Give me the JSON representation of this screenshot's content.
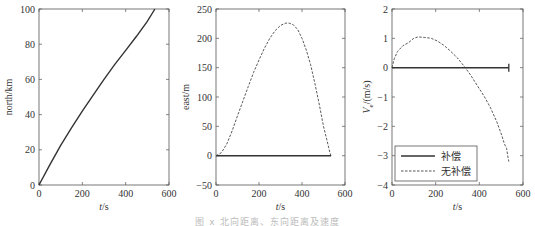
{
  "chart_data": [
    {
      "type": "line",
      "title": "",
      "xlabel": "t/s",
      "ylabel": "north/km",
      "xlim": [
        0,
        600
      ],
      "ylim": [
        0,
        100
      ],
      "xticks": [
        0,
        200,
        400,
        600
      ],
      "yticks": [
        0,
        20,
        40,
        60,
        80,
        100
      ],
      "grid": false,
      "series": [
        {
          "name": "north",
          "style": "solid",
          "x": [
            0,
            50,
            100,
            150,
            200,
            250,
            300,
            350,
            400,
            450,
            500,
            535
          ],
          "y": [
            0,
            11.5,
            22.5,
            32.5,
            42,
            51,
            60,
            68.5,
            76.5,
            84.5,
            93,
            100
          ]
        }
      ]
    },
    {
      "type": "line",
      "title": "",
      "xlabel": "t/s",
      "ylabel": "east/m",
      "xlim": [
        0,
        600
      ],
      "ylim": [
        -50,
        250
      ],
      "xticks": [
        0,
        200,
        400,
        600
      ],
      "yticks": [
        -50,
        0,
        50,
        100,
        150,
        200,
        250
      ],
      "grid": false,
      "series": [
        {
          "name": "补偿",
          "style": "solid",
          "x": [
            0,
            535
          ],
          "y": [
            0,
            0
          ]
        },
        {
          "name": "无补偿",
          "style": "dashed",
          "x": [
            0,
            25,
            50,
            75,
            100,
            125,
            150,
            175,
            200,
            225,
            250,
            275,
            300,
            325,
            340,
            360,
            380,
            400,
            420,
            440,
            460,
            480,
            500,
            515,
            530,
            535
          ],
          "y": [
            0,
            5,
            20,
            42,
            68,
            93,
            118,
            142,
            163,
            183,
            200,
            213,
            222,
            226,
            226,
            223,
            215,
            200,
            180,
            155,
            123,
            88,
            50,
            28,
            5,
            0
          ]
        }
      ]
    },
    {
      "type": "line",
      "title": "",
      "xlabel": "t/s",
      "ylabel": "V_e/(m/s)",
      "xlim": [
        0,
        600
      ],
      "ylim": [
        -4,
        2
      ],
      "xticks": [
        0,
        200,
        400,
        600
      ],
      "yticks": [
        -4,
        -3,
        -2,
        -1,
        0,
        1,
        2
      ],
      "grid": false,
      "legend": {
        "position": "lower left",
        "entries": [
          "补偿",
          "无补偿"
        ]
      },
      "series": [
        {
          "name": "补偿",
          "style": "solid",
          "x": [
            0,
            535
          ],
          "y": [
            0,
            0
          ]
        },
        {
          "name": "无补偿",
          "style": "dashed",
          "x": [
            0,
            10,
            25,
            50,
            75,
            100,
            120,
            150,
            180,
            210,
            240,
            270,
            300,
            330,
            360,
            390,
            420,
            450,
            480,
            500,
            515,
            525,
            530,
            535
          ],
          "y": [
            0,
            0.3,
            0.55,
            0.75,
            0.85,
            1.0,
            1.05,
            1.03,
            1.0,
            0.9,
            0.75,
            0.55,
            0.33,
            0.05,
            -0.25,
            -0.6,
            -0.95,
            -1.35,
            -1.85,
            -2.25,
            -2.6,
            -2.75,
            -3.0,
            -3.2
          ]
        }
      ]
    }
  ],
  "figure": {
    "xlabel_text": "t/s",
    "panels": [
      {
        "ylabel": "north/km"
      },
      {
        "ylabel": "east/m"
      },
      {
        "ylabel_main": "V",
        "ylabel_sub": "e",
        "ylabel_rest": "/(m/s)"
      }
    ],
    "legend": {
      "items": [
        {
          "label": "补偿",
          "style": "solid"
        },
        {
          "label": "无补偿",
          "style": "dashed"
        }
      ]
    },
    "caption": "图 x  北向距离、东向距离及速度"
  },
  "colors": {
    "axis": "#555555",
    "line": "#333333",
    "dashed": "#444444"
  }
}
